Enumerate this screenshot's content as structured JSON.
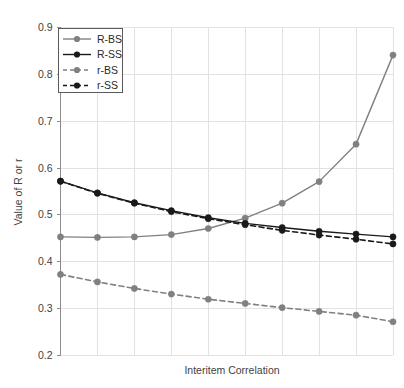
{
  "chart_data": {
    "type": "line",
    "title": "",
    "xlabel": "Interitem Correlation",
    "ylabel": "Value of R or r",
    "ylim": [
      0.2,
      0.9
    ],
    "yticks": [
      "0.2",
      "0.3",
      "0.4",
      "0.5",
      "0.6",
      "0.7",
      "0.8",
      "0.9"
    ],
    "ytick_values": [
      0.2,
      0.3,
      0.4,
      0.5,
      0.6,
      0.7,
      0.8,
      0.9
    ],
    "xticks": [],
    "xtick_values": [
      1,
      2,
      3,
      4,
      5,
      6,
      7,
      8,
      9,
      10
    ],
    "grid": true,
    "legend_position": "top-left",
    "x": [
      1,
      2,
      3,
      4,
      5,
      6,
      7,
      8,
      9,
      10
    ],
    "series": [
      {
        "name": "R-BS",
        "color": "#808080",
        "dash": "solid",
        "marker": "circle",
        "values": [
          0.452,
          0.451,
          0.452,
          0.457,
          0.47,
          0.492,
          0.524,
          0.57,
          0.65,
          0.84
        ]
      },
      {
        "name": "R-SS",
        "color": "#1a1a1a",
        "dash": "solid",
        "marker": "circle",
        "values": [
          0.571,
          0.546,
          0.525,
          0.508,
          0.493,
          0.481,
          0.472,
          0.464,
          0.458,
          0.452
        ]
      },
      {
        "name": "r-BS",
        "color": "#808080",
        "dash": "dashed",
        "marker": "circle",
        "values": [
          0.372,
          0.356,
          0.342,
          0.33,
          0.319,
          0.31,
          0.301,
          0.293,
          0.285,
          0.271
        ]
      },
      {
        "name": "r-SS",
        "color": "#1a1a1a",
        "dash": "dashed",
        "marker": "circle",
        "values": [
          0.571,
          0.545,
          0.524,
          0.506,
          0.491,
          0.478,
          0.466,
          0.456,
          0.447,
          0.437
        ]
      }
    ]
  },
  "legend": {
    "entries": [
      {
        "label": "R-BS"
      },
      {
        "label": "R-SS"
      },
      {
        "label": "r-BS"
      },
      {
        "label": "r-SS"
      }
    ]
  },
  "axes": {
    "y_title": "Value of R or r",
    "x_title": "Interitem Correlation",
    "y_tick_labels": [
      "0.9",
      "0.8",
      "0.7",
      "0.6",
      "0.5",
      "0.4",
      "0.3",
      "0.2"
    ]
  },
  "colors": {
    "gray_series": "#808080",
    "black_series": "#1a1a1a",
    "gridline": "#e2e2e2",
    "axis": "#8c8c8c",
    "text": "#3f3f3f",
    "background": "#ffffff"
  }
}
